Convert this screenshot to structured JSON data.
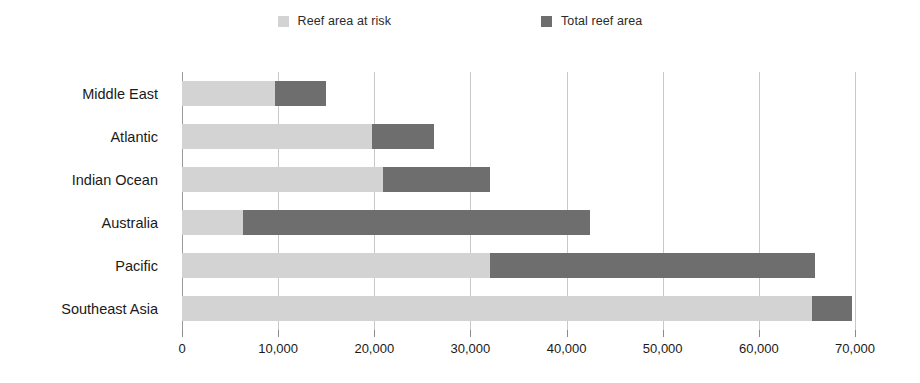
{
  "chart_data": {
    "type": "bar",
    "orientation": "horizontal",
    "stacked": true,
    "title": "",
    "subtitle": "",
    "xlabel": "",
    "ylabel": "",
    "xlim": [
      0,
      70000
    ],
    "xtick_step": 10000,
    "grid": true,
    "legend_position": "top-center",
    "categories": [
      "Middle East",
      "Atlantic",
      "Indian Ocean",
      "Australia",
      "Pacific",
      "Southeast Asia"
    ],
    "series": [
      {
        "name": "Reef area at risk",
        "color": "#d3d3d3",
        "values": [
          9700,
          19800,
          20900,
          6300,
          32000,
          65500
        ]
      },
      {
        "name": "Total reef area",
        "color": "#6e6e6e",
        "values": [
          15000,
          26200,
          32000,
          42400,
          65800,
          69700
        ]
      }
    ],
    "xticks": [
      0,
      10000,
      20000,
      30000,
      40000,
      50000,
      60000,
      70000
    ],
    "xtick_labels": [
      "0",
      "10,000",
      "20,000",
      "30,000",
      "40,000",
      "50,000",
      "60,000",
      "70,000"
    ]
  },
  "legend": {
    "items": [
      {
        "label": "Reef area at risk",
        "color": "#d3d3d3"
      },
      {
        "label": "Total reef area",
        "color": "#6e6e6e"
      }
    ]
  },
  "colors": {
    "at_risk": "#d3d3d3",
    "total": "#6e6e6e",
    "grid": "#c8c8c8",
    "axis": "#9a9a9a",
    "text": "#1a1a1a",
    "background": "#ffffff"
  }
}
